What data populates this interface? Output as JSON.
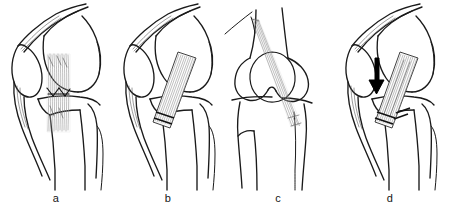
{
  "figure": {
    "background_color": "#ffffff",
    "ink_color": "#1a1a1a",
    "fiber_color": "#8a8a8a",
    "accent_color": "#000000",
    "width_px": 449,
    "height_px": 215
  },
  "panels": [
    {
      "id": "a",
      "label": "a",
      "view": "lateral",
      "anatomy": [
        "patella",
        "quadriceps-tendon",
        "femoral-condyle",
        "tibia",
        "fibula",
        "patellar-tendon"
      ],
      "graft": {
        "name": "vertical-hatched-graft",
        "orientation": "vertical",
        "fixation": "suture-anchors-at-joint-line"
      },
      "arrow": false
    },
    {
      "id": "b",
      "label": "b",
      "view": "lateral",
      "anatomy": [
        "patella",
        "quadriceps-tendon",
        "femoral-condyle",
        "tibia",
        "fibula",
        "patellar-tendon"
      ],
      "graft": {
        "name": "oblique-graft-strip",
        "orientation": "oblique",
        "fixation": "staples-at-distal-end"
      },
      "arrow": false
    },
    {
      "id": "c",
      "label": "c",
      "view": "anterior",
      "anatomy": [
        "patella-circular",
        "femoral-condyles",
        "tibia",
        "fibula"
      ],
      "graft": {
        "name": "long-diagonal-graft-strip",
        "orientation": "diagonal",
        "fixation": "free-distal-tail"
      },
      "arrow": false
    },
    {
      "id": "d",
      "label": "d",
      "view": "lateral",
      "anatomy": [
        "patella",
        "quadriceps-tendon",
        "femoral-condyle",
        "tibia",
        "fibula",
        "patellar-tendon"
      ],
      "graft": {
        "name": "oblique-graft-strip-tensioned",
        "orientation": "oblique",
        "fixation": "double-staple-at-distal-end"
      },
      "arrow": true,
      "arrow_meaning": "tensioning-direction"
    }
  ]
}
